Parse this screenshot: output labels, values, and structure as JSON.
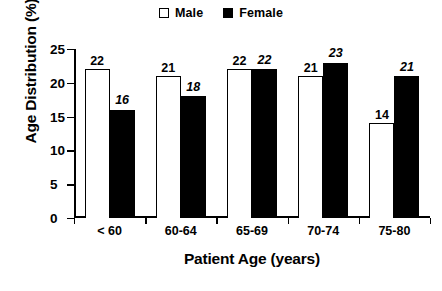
{
  "chart_data": {
    "type": "bar",
    "title": "",
    "xlabel": "Patient Age (years)",
    "ylabel": "Age Distribution (%)",
    "categories": [
      "< 60",
      "60-64",
      "65-69",
      "70-74",
      "75-80"
    ],
    "series": [
      {
        "name": "Male",
        "values": [
          22,
          21,
          22,
          21,
          14
        ],
        "swatch": "open",
        "color": "#ffffff"
      },
      {
        "name": "Female",
        "values": [
          16,
          18,
          22,
          23,
          21
        ],
        "swatch": "filled",
        "color": "#000000"
      }
    ],
    "value_labels": {
      "male": [
        "22",
        "21",
        "22",
        "21",
        "14"
      ],
      "female": [
        "16",
        "18",
        "22",
        "23",
        "21"
      ]
    },
    "ylim": [
      0,
      25
    ],
    "yticks": [
      0,
      5,
      10,
      15,
      20,
      25
    ],
    "ytick_labels": [
      "0",
      "5",
      "10",
      "15",
      "20",
      "25"
    ],
    "grid": false,
    "legend_position": "top-center"
  },
  "legend": {
    "entries": [
      {
        "label": "Male"
      },
      {
        "label": "Female"
      }
    ]
  },
  "axes": {
    "y_title": "Age Distribution (%)",
    "x_title": "Patient Age (years)"
  }
}
